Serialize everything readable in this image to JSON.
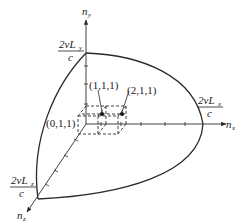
{
  "figure": {
    "type": "k-space octant diagram",
    "axes": {
      "y": {
        "label": "n",
        "subscript": "y"
      },
      "x": {
        "label": "n",
        "subscript": "x"
      },
      "z": {
        "label": "n",
        "subscript": "z"
      }
    },
    "intercepts": {
      "y": {
        "numerator_prefix": "2νL",
        "subscript": "y",
        "denominator": "c"
      },
      "x": {
        "numerator_prefix": "2νL",
        "subscript": "x",
        "denominator": "c"
      },
      "z": {
        "numerator_prefix": "2νL",
        "subscript": "z",
        "denominator": "c"
      }
    },
    "points": [
      {
        "label": "(0,1,1)"
      },
      {
        "label": "(1,1,1)"
      },
      {
        "label": "(2,1,1)"
      }
    ],
    "colors": {
      "line": "#2a2a2a",
      "background": "#ffffff"
    }
  }
}
